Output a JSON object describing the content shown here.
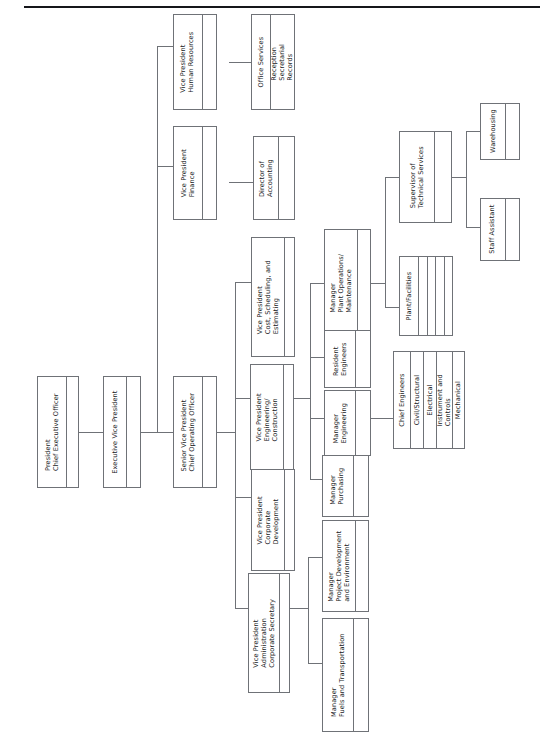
{
  "document": {
    "type": "organization-chart",
    "orientation": "rotated-90-ccw",
    "title": "Corporate Organization Chart"
  },
  "nodes": {
    "president": {
      "label": "President\nChief Executive Officer"
    },
    "evp": {
      "label": "Executive Vice President"
    },
    "svp": {
      "label": "Senior Vice President\nChief Operating Officer"
    },
    "vp_hr": {
      "label": "Vice President\nHuman Resources"
    },
    "vp_finance": {
      "label": "Vice President\nFinance"
    },
    "office_services": {
      "label": "Office Services"
    },
    "office_services_list": {
      "label": "Reception\nSecretarial\nRecords"
    },
    "dir_accounting": {
      "label": "Director of\nAccounting"
    },
    "vp_cost": {
      "label": "Vice President\nCost, Scheduling, and\nEstimating"
    },
    "vp_engr": {
      "label": "Vice President\nEngineering/\nConstruction"
    },
    "vp_corpdev": {
      "label": "Vice President\nCorporate\nDevelopment"
    },
    "vp_admin": {
      "label": "Vice President\nAdministration\nCorporate Secretary"
    },
    "mgr_plant": {
      "label": "Manager\nPlant Operations/\nMaintenance"
    },
    "resident_engr": {
      "label": "Resident\nEngineers"
    },
    "mgr_engr": {
      "label": "Manager\nEngineering"
    },
    "mgr_purchasing": {
      "label": "Manager\nPurchasing"
    },
    "mgr_projdev": {
      "label": "Manager\nProject Development\nand Environment"
    },
    "mgr_fuels": {
      "label": "Manager\nFuels and Transportation"
    },
    "sup_tech": {
      "label": "Supervisor of\nTechnical Services"
    },
    "plant_facilities": {
      "label": "Plant/Facilities"
    },
    "warehousing": {
      "label": "Warehousing"
    },
    "staff_assistant": {
      "label": "Staff Assistant"
    },
    "chief_engineers": {
      "label": "Chief Engineers"
    },
    "civil_structural": {
      "label": "Civil/Structural"
    },
    "electrical": {
      "label": "Electrical"
    },
    "instr_controls": {
      "label": "Instrument and\nControls"
    },
    "mechanical": {
      "label": "Mechanical"
    }
  },
  "chart_data": {
    "type": "diagram",
    "levels": [
      {
        "level": 1,
        "nodes": [
          "President / Chief Executive Officer"
        ]
      },
      {
        "level": 2,
        "nodes": [
          "Executive Vice President"
        ]
      },
      {
        "level": 3,
        "nodes": [
          "Senior Vice President / Chief Operating Officer",
          "Vice President Finance",
          "Vice President Human Resources"
        ]
      },
      {
        "level": 4,
        "nodes": [
          "Vice President Cost, Scheduling, and Estimating",
          "Vice President Engineering/Construction",
          "Vice President Corporate Development",
          "Vice President Administration / Corporate Secretary",
          "Director of Accounting",
          "Office Services"
        ]
      },
      {
        "level": 5,
        "nodes": [
          "Manager Plant Operations/Maintenance",
          "Resident Engineers",
          "Manager Engineering",
          "Manager Purchasing",
          "Manager Project Development and Environment",
          "Manager Fuels and Transportation",
          "Reception / Secretarial / Records"
        ]
      },
      {
        "level": 6,
        "nodes": [
          "Supervisor of Technical Services",
          "Plant/Facilities",
          "Chief Engineers"
        ]
      },
      {
        "level": 7,
        "nodes": [
          "Warehousing",
          "Staff Assistant",
          "Civil/Structural",
          "Electrical",
          "Instrument and Controls",
          "Mechanical"
        ]
      }
    ],
    "edges": [
      {
        "from": "President / Chief Executive Officer",
        "to": "Executive Vice President"
      },
      {
        "from": "Executive Vice President",
        "to": "Senior Vice President / Chief Operating Officer"
      },
      {
        "from": "Executive Vice President",
        "to": "Vice President Finance"
      },
      {
        "from": "Executive Vice President",
        "to": "Vice President Human Resources"
      },
      {
        "from": "Vice President Finance",
        "to": "Director of Accounting"
      },
      {
        "from": "Vice President Human Resources",
        "to": "Office Services"
      },
      {
        "from": "Office Services",
        "to": "Reception / Secretarial / Records"
      },
      {
        "from": "Senior Vice President / Chief Operating Officer",
        "to": "Vice President Cost, Scheduling, and Estimating"
      },
      {
        "from": "Senior Vice President / Chief Operating Officer",
        "to": "Vice President Engineering/Construction"
      },
      {
        "from": "Senior Vice President / Chief Operating Officer",
        "to": "Vice President Corporate Development"
      },
      {
        "from": "Senior Vice President / Chief Operating Officer",
        "to": "Vice President Administration / Corporate Secretary"
      },
      {
        "from": "Vice President Engineering/Construction",
        "to": "Manager Plant Operations/Maintenance"
      },
      {
        "from": "Vice President Engineering/Construction",
        "to": "Resident Engineers"
      },
      {
        "from": "Vice President Engineering/Construction",
        "to": "Manager Engineering"
      },
      {
        "from": "Vice President Engineering/Construction",
        "to": "Manager Purchasing"
      },
      {
        "from": "Vice President Administration / Corporate Secretary",
        "to": "Manager Project Development and Environment"
      },
      {
        "from": "Vice President Administration / Corporate Secretary",
        "to": "Manager Fuels and Transportation"
      },
      {
        "from": "Manager Plant Operations/Maintenance",
        "to": "Supervisor of Technical Services"
      },
      {
        "from": "Manager Plant Operations/Maintenance",
        "to": "Plant/Facilities"
      },
      {
        "from": "Supervisor of Technical Services",
        "to": "Warehousing"
      },
      {
        "from": "Supervisor of Technical Services",
        "to": "Staff Assistant"
      },
      {
        "from": "Manager Engineering",
        "to": "Chief Engineers"
      },
      {
        "from": "Chief Engineers",
        "to": "Civil/Structural"
      },
      {
        "from": "Chief Engineers",
        "to": "Electrical"
      },
      {
        "from": "Chief Engineers",
        "to": "Instrument and Controls"
      },
      {
        "from": "Chief Engineers",
        "to": "Mechanical"
      }
    ]
  }
}
